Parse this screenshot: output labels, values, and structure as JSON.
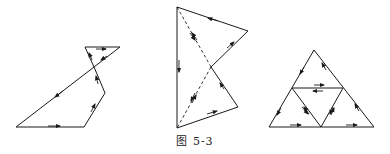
{
  "caption": "图 5-3",
  "colors": {
    "line": "#1a1a1a",
    "background": "#ffffff"
  },
  "figures": [
    {
      "name": "figure-left",
      "description": "small triangle atop a quadrilateral, joined at a vertex, boundaries oriented with arrows",
      "polygons": [
        {
          "points": [
            [
              85,
              47
            ],
            [
              120,
              47
            ],
            [
              94,
              67
            ]
          ]
        },
        {
          "points": [
            [
              94,
              67
            ],
            [
              16,
              127
            ],
            [
              84,
              127
            ],
            [
              105,
              93
            ]
          ]
        }
      ],
      "arrows": [
        {
          "x1": 96,
          "y1": 49,
          "x2": 106,
          "y2": 49
        },
        {
          "x1": 107,
          "y1": 56,
          "x2": 101,
          "y2": 60
        },
        {
          "x1": 92,
          "y1": 60,
          "x2": 89,
          "y2": 53
        },
        {
          "x1": 63,
          "y1": 91,
          "x2": 55,
          "y2": 97
        },
        {
          "x1": 48,
          "y1": 126,
          "x2": 60,
          "y2": 126
        },
        {
          "x1": 91,
          "y1": 112,
          "x2": 95,
          "y2": 104
        },
        {
          "x1": 98,
          "y1": 84,
          "x2": 96,
          "y2": 76
        }
      ]
    },
    {
      "name": "figure-middle",
      "description": "concave quadrilateral split by dashed diagonals into two triangles with opposing arrows",
      "polygons": [
        {
          "points": [
            [
              177,
              7
            ],
            [
              248,
              31
            ],
            [
              211,
              67
            ],
            [
              238,
              107
            ],
            [
              177,
              128
            ]
          ]
        }
      ],
      "dashed": [
        {
          "x1": 177,
          "y1": 7,
          "x2": 211,
          "y2": 67
        },
        {
          "x1": 211,
          "y1": 67,
          "x2": 177,
          "y2": 128
        }
      ],
      "arrows": [
        {
          "x1": 218,
          "y1": 21,
          "x2": 208,
          "y2": 18
        },
        {
          "x1": 227,
          "y1": 48,
          "x2": 234,
          "y2": 42
        },
        {
          "x1": 179,
          "y1": 60,
          "x2": 179,
          "y2": 72
        },
        {
          "x1": 224,
          "y1": 89,
          "x2": 220,
          "y2": 83
        },
        {
          "x1": 207,
          "y1": 114,
          "x2": 217,
          "y2": 111
        },
        {
          "x1": 190,
          "y1": 33,
          "x2": 195,
          "y2": 40
        },
        {
          "x1": 197,
          "y1": 40,
          "x2": 192,
          "y2": 33
        },
        {
          "x1": 195,
          "y1": 93,
          "x2": 191,
          "y2": 101
        },
        {
          "x1": 192,
          "y1": 103,
          "x2": 196,
          "y2": 95
        }
      ]
    },
    {
      "name": "figure-right",
      "description": "large triangle subdivided into four sub-triangles with oriented edges",
      "polygons": [
        {
          "points": [
            [
              314,
              50
            ],
            [
              269,
              127
            ],
            [
              374,
              127
            ]
          ]
        },
        {
          "points": [
            [
              292,
              88
            ],
            [
              343,
              88
            ],
            [
              321,
              127
            ]
          ]
        }
      ],
      "arrows": [
        {
          "x1": 304,
          "y1": 67,
          "x2": 300,
          "y2": 74
        },
        {
          "x1": 326,
          "y1": 70,
          "x2": 322,
          "y2": 63
        },
        {
          "x1": 314,
          "y1": 85,
          "x2": 324,
          "y2": 85
        },
        {
          "x1": 323,
          "y1": 91,
          "x2": 313,
          "y2": 91
        },
        {
          "x1": 281,
          "y1": 108,
          "x2": 277,
          "y2": 115
        },
        {
          "x1": 302,
          "y1": 107,
          "x2": 308,
          "y2": 114
        },
        {
          "x1": 309,
          "y1": 114,
          "x2": 304,
          "y2": 107
        },
        {
          "x1": 333,
          "y1": 107,
          "x2": 330,
          "y2": 114
        },
        {
          "x1": 331,
          "y1": 115,
          "x2": 334,
          "y2": 108
        },
        {
          "x1": 359,
          "y1": 111,
          "x2": 355,
          "y2": 104
        },
        {
          "x1": 290,
          "y1": 125,
          "x2": 301,
          "y2": 125
        },
        {
          "x1": 346,
          "y1": 125,
          "x2": 357,
          "y2": 125
        }
      ]
    }
  ]
}
